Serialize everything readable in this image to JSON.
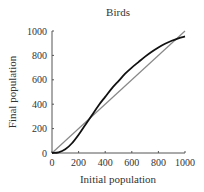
{
  "chart_data": {
    "type": "line",
    "title": "Birds",
    "xlabel": "Initial population",
    "ylabel": "Final population",
    "xlim": [
      0,
      1000
    ],
    "ylim": [
      0,
      1000
    ],
    "xticks": [
      0,
      200,
      400,
      600,
      800,
      1000
    ],
    "yticks": [
      0,
      200,
      400,
      600,
      800,
      1000
    ],
    "grid": false,
    "legend": null,
    "series": [
      {
        "name": "Population map curve",
        "color": "#111111",
        "x": [
          0,
          50,
          100,
          150,
          200,
          250,
          300,
          350,
          400,
          450,
          500,
          550,
          600,
          650,
          700,
          750,
          800,
          850,
          900,
          950,
          1000
        ],
        "y": [
          0,
          5,
          30,
          80,
          150,
          230,
          310,
          390,
          460,
          530,
          590,
          650,
          700,
          745,
          790,
          830,
          865,
          895,
          920,
          940,
          955
        ]
      },
      {
        "name": "Identity line (y = x)",
        "color": "#888888",
        "x": [
          0,
          1000
        ],
        "y": [
          0,
          1000
        ]
      }
    ]
  }
}
